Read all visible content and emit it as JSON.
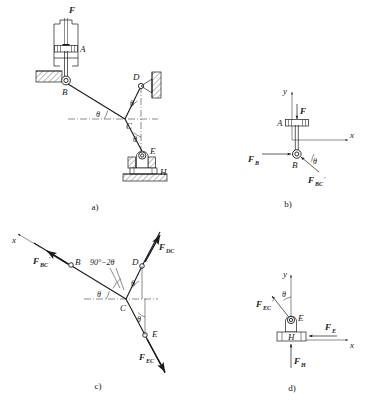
{
  "figure": {
    "panels": [
      {
        "id": "a",
        "caption": "a)",
        "role": "mechanism-assembly",
        "points": [
          "A",
          "B",
          "C",
          "D",
          "E",
          "H"
        ],
        "loads": [
          "F"
        ],
        "angles": [
          "θ",
          "θ",
          "θ"
        ]
      },
      {
        "id": "b",
        "caption": "b)",
        "role": "free-body-piston-AB",
        "points": [
          "A",
          "B"
        ],
        "loads": [
          "F",
          "F_B",
          "F_BC'"
        ],
        "axes": [
          "x",
          "y"
        ],
        "angles": [
          "θ"
        ]
      },
      {
        "id": "c",
        "caption": "c)",
        "role": "free-body-joint-C",
        "points": [
          "B",
          "C",
          "D",
          "E"
        ],
        "loads": [
          "F_BC'",
          "F_DC",
          "F_EC"
        ],
        "axes": [
          "x"
        ],
        "angles": [
          "θ",
          "θ",
          "θ",
          "90°−2θ"
        ]
      },
      {
        "id": "d",
        "caption": "d)",
        "role": "free-body-slider-EH",
        "points": [
          "E",
          "H"
        ],
        "loads": [
          "F_EC'",
          "F_E",
          "F_H"
        ],
        "axes": [
          "x",
          "y"
        ],
        "angles": [
          "θ"
        ]
      }
    ],
    "labels": {
      "point_A": "A",
      "point_B": "B",
      "point_C": "C",
      "point_D": "D",
      "point_E": "E",
      "point_H": "H",
      "force_F": "F",
      "force_F_base": "F",
      "force_FB_base": "F",
      "force_FB_sub": "B",
      "force_FBC_base": "F",
      "force_FBC_sub": "BC",
      "force_FBC_prime": "′",
      "force_FDC_base": "F",
      "force_FDC_sub": "DC",
      "force_FEC_base": "F",
      "force_FEC_sub": "EC",
      "force_FEC_prime": "′",
      "force_FE_base": "F",
      "force_FE_sub": "E",
      "force_FH_base": "F",
      "force_FH_sub": "H",
      "axis_x": "x",
      "axis_y": "y",
      "theta": "θ",
      "angle_expr": "90°−2θ",
      "caption_a": "a)",
      "caption_b": "b)",
      "caption_c": "c)",
      "caption_d": "d)"
    },
    "colors": {
      "ink": "#1a1a1a",
      "paper": "#ffffff",
      "hatch": "#555555"
    }
  }
}
